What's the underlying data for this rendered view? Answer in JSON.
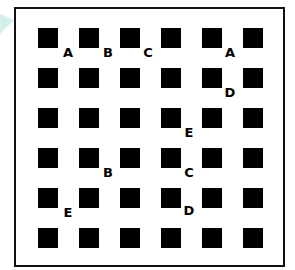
{
  "grid": {
    "rows": 6,
    "cols": 6,
    "square_color": "#000000",
    "frame_color": "#111111",
    "background": "#ffffff"
  },
  "labels": [
    {
      "text": "A",
      "x": 68,
      "y": 52
    },
    {
      "text": "B",
      "x": 108,
      "y": 52
    },
    {
      "text": "C",
      "x": 148,
      "y": 52
    },
    {
      "text": "A",
      "x": 230,
      "y": 52
    },
    {
      "text": "D",
      "x": 230,
      "y": 92
    },
    {
      "text": "E",
      "x": 189,
      "y": 132
    },
    {
      "text": "B",
      "x": 108,
      "y": 172
    },
    {
      "text": "C",
      "x": 189,
      "y": 172
    },
    {
      "text": "E",
      "x": 68,
      "y": 212
    },
    {
      "text": "D",
      "x": 189,
      "y": 210
    }
  ]
}
